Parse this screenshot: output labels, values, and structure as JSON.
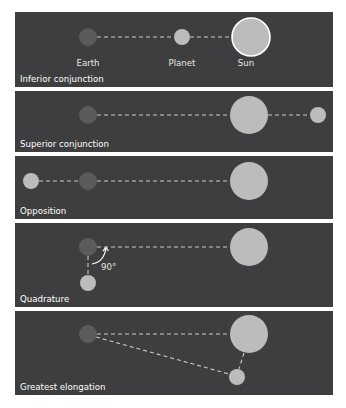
{
  "figure": {
    "panels": [
      {
        "title": "Inferior conjunction",
        "labels": {
          "earth": "Earth",
          "planet": "Planet",
          "sun": "Sun"
        }
      },
      {
        "title": "Superior conjunction"
      },
      {
        "title": "Opposition"
      },
      {
        "title": "Quadrature",
        "angle_label": "90°"
      },
      {
        "title": "Greatest elongation"
      }
    ]
  },
  "colors": {
    "panel_background": "#3e3e40",
    "earth": "#5b5b5d",
    "planet_and_sun": "#bcbcbc",
    "page_background": "#ffffff"
  }
}
